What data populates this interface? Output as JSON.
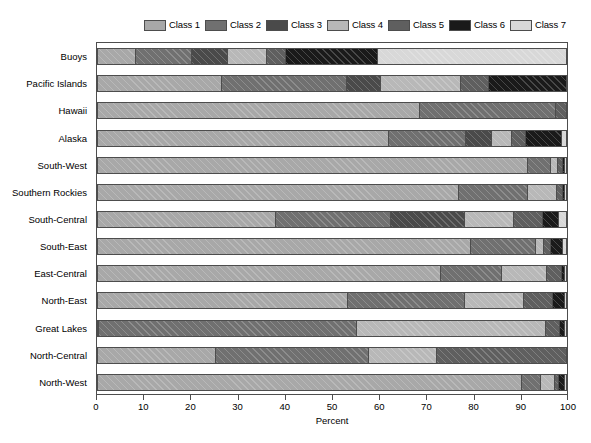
{
  "chart_data": {
    "type": "bar",
    "orientation": "horizontal",
    "stacked": true,
    "stack_mode": "percent",
    "title": "",
    "xlabel": "Percent",
    "ylabel": "",
    "xlim": [
      0,
      100
    ],
    "xticks": [
      0,
      10,
      20,
      30,
      40,
      50,
      60,
      70,
      80,
      90,
      100
    ],
    "xticklabels": [
      "0",
      "10",
      "20",
      "30",
      "40",
      "50",
      "60",
      "70",
      "80",
      "90",
      "100"
    ],
    "grid": false,
    "legend_position": "top",
    "legend": [
      "Class 1",
      "Class 2",
      "Class 3",
      "Class 4",
      "Class 5",
      "Class 6",
      "Class 7"
    ],
    "colors": [
      "#a8a8a8",
      "#707070",
      "#4a4a4a",
      "#b8b8b8",
      "#5f5f5f",
      "#1a1a1a",
      "#d8d8d8"
    ],
    "categories": [
      "Buoys",
      "Pacific Islands",
      "Hawaii",
      "Alaska",
      "South-West",
      "Southern Rockies",
      "South-Central",
      "South-East",
      "East-Central",
      "North-East",
      "Great Lakes",
      "North-Central",
      "North-West"
    ],
    "series": [
      {
        "name": "Class 1",
        "values": [
          8.2,
          26.6,
          68.8,
          62.2,
          91.7,
          77.0,
          38.0,
          79.6,
          73.2,
          53.5,
          0.3,
          25.3,
          90.4
        ]
      },
      {
        "name": "Class 2",
        "values": [
          12.1,
          26.5,
          28.8,
          16.3,
          4.9,
          14.6,
          24.5,
          13.9,
          13.0,
          24.8,
          55.0,
          32.5,
          4.1
        ]
      },
      {
        "name": "Class 3",
        "values": [
          7.6,
          7.4,
          0.0,
          5.6,
          0.0,
          0.0,
          15.8,
          0.0,
          0.0,
          0.0,
          0.0,
          0.0,
          0.0
        ]
      },
      {
        "name": "Class 4",
        "values": [
          8.3,
          16.9,
          0.0,
          4.1,
          1.4,
          6.2,
          10.5,
          1.6,
          9.5,
          12.6,
          40.2,
          14.6,
          2.9
        ]
      },
      {
        "name": "Class 5",
        "values": [
          4.0,
          6.0,
          2.4,
          3.1,
          1.1,
          1.3,
          6.2,
          1.6,
          3.3,
          6.1,
          3.0,
          27.6,
          1.0
        ]
      },
      {
        "name": "Class 6",
        "values": [
          19.7,
          16.6,
          0.0,
          7.6,
          0.5,
          0.4,
          3.3,
          2.4,
          0.6,
          2.6,
          1.0,
          0.0,
          1.2
        ]
      },
      {
        "name": "Class 7",
        "values": [
          40.1,
          0.0,
          0.0,
          1.1,
          0.4,
          0.5,
          1.7,
          0.9,
          0.4,
          0.4,
          0.5,
          0.0,
          0.4
        ]
      }
    ]
  },
  "axes": {
    "x_title": "Percent"
  }
}
